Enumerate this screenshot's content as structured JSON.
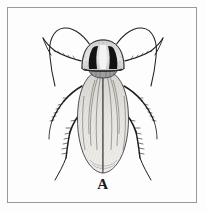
{
  "figure": {
    "label": "A",
    "caption_text": "A",
    "technique": "pen-and-ink stipple line drawing",
    "background_color": "#fdfdfd",
    "ink_color": "#1a1a1a",
    "frame": {
      "border_color": "#9a9a9a",
      "border_width_px": 1,
      "inset_px": 7,
      "width_px": 190,
      "height_px": 196
    }
  },
  "anatomy": {
    "head": {
      "name": "head",
      "shape": "small rounded capsule tucked under pronotum",
      "fill": "#bdbdbd"
    },
    "pronotum": {
      "name": "pronotum",
      "shape": "broad rounded shield",
      "pattern": "two thick dark vertical bands flanking a pale median stripe, pale translucent margin",
      "dark_band_color": "#141414",
      "pale_stripe_color": "#f2f2f2",
      "rim_color": "#d9d9d9"
    },
    "tegmina": {
      "name": "forewings",
      "shape": "elongate overlapping oval wing pads reaching past abdomen tip",
      "fill": "#e6e4e0",
      "venation": "longitudinal branching veins with fine hatching"
    },
    "antennae": {
      "name": "antennae",
      "count": 2,
      "shape": "long filamentous, arcing upward and outward over the head"
    },
    "legs": {
      "name": "legs",
      "count": 6,
      "pairs": [
        "prothoracic",
        "mesothoracic",
        "metathoracic"
      ],
      "detail": "spinose femora and tibiae with bristles, slender tarsi"
    },
    "cerci": {
      "name": "cerci",
      "count": 2,
      "visible": false
    }
  },
  "colors": {
    "ink": "#1a1a1a",
    "mid_gray": "#6f6f6f",
    "light_gray": "#b5b5b5",
    "paper": "#fdfdfd",
    "frame": "#9a9a9a"
  }
}
